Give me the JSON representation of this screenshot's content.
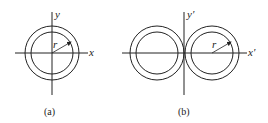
{
  "figure_a": {
    "caption": "(a)",
    "axis_x_label": "x",
    "axis_y_label": "y",
    "radius_label": "r"
  },
  "figure_b": {
    "caption": "(b)",
    "axis_x_label": "x′",
    "axis_y_label": "y′",
    "radius_label": "r"
  },
  "colors": {
    "stroke": "#222222",
    "background": "#ffffff"
  }
}
